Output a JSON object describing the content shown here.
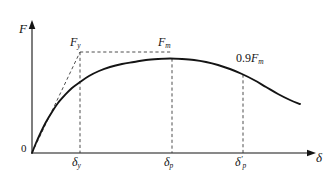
{
  "figure": {
    "name": "load-displacement-curve",
    "background_color": "#ffffff",
    "line_color": "#141414",
    "dash_color": "#3a3a3a"
  },
  "axes": {
    "y_label": "F",
    "x_label": "δ",
    "origin_label": "0",
    "x_axis_start_px": 32,
    "x_axis_end_px": 318,
    "y_axis_top_px": 22,
    "baseline_px": 153
  },
  "annotations": {
    "fy": {
      "text": "F",
      "sub": "y"
    },
    "fm": {
      "text": "F",
      "sub": "m"
    },
    "nine_tenths_fm": {
      "prefix": "0.9",
      "text": "F",
      "sub": "m"
    },
    "delta_y": {
      "text": "δ",
      "sub": "y"
    },
    "delta_p": {
      "text": "δ",
      "sub": "p"
    },
    "delta_p_prime": {
      "text": "δ",
      "prime": "′",
      "sub": "p"
    }
  },
  "chart_data": {
    "type": "line",
    "title": "",
    "xlabel": "δ",
    "ylabel": "F",
    "grid": false,
    "legend": null,
    "xlim": [
      0,
      1
    ],
    "ylim": [
      0,
      1
    ],
    "series": [
      {
        "name": "load-displacement-curve",
        "style": "solid",
        "points_px": [
          [
            32,
            153
          ],
          [
            36,
            143
          ],
          [
            41,
            132
          ],
          [
            46,
            122
          ],
          [
            52,
            112
          ],
          [
            58,
            103
          ],
          [
            65,
            95
          ],
          [
            72,
            88
          ],
          [
            80,
            82
          ],
          [
            89,
            76
          ],
          [
            99,
            71
          ],
          [
            110,
            67
          ],
          [
            122,
            64
          ],
          [
            134,
            62
          ],
          [
            146,
            60
          ],
          [
            158,
            59
          ],
          [
            170,
            58.5
          ],
          [
            182,
            59
          ],
          [
            194,
            60
          ],
          [
            206,
            62
          ],
          [
            218,
            65
          ],
          [
            230,
            69
          ],
          [
            242,
            74
          ],
          [
            254,
            80
          ],
          [
            266,
            87
          ],
          [
            278,
            94
          ],
          [
            290,
            100
          ],
          [
            300,
            104
          ]
        ]
      },
      {
        "name": "idealized-elastic-segment",
        "style": "dashed",
        "points_px": [
          [
            32,
            153
          ],
          [
            80,
            52
          ]
        ]
      },
      {
        "name": "fy-horizontal-dashed",
        "style": "dashed",
        "points_px": [
          [
            80,
            52
          ],
          [
            172,
            52
          ]
        ]
      },
      {
        "name": "delta-y-vertical-dashed",
        "style": "dashed",
        "points_px": [
          [
            80,
            52
          ],
          [
            80,
            153
          ]
        ]
      },
      {
        "name": "delta-p-vertical-dashed",
        "style": "dashed",
        "points_px": [
          [
            172,
            58.5
          ],
          [
            172,
            153
          ]
        ]
      },
      {
        "name": "delta-p-prime-vertical-dashed",
        "style": "dashed",
        "points_px": [
          [
            243,
            74.5
          ],
          [
            243,
            153
          ]
        ]
      }
    ],
    "markers": [
      {
        "name": "yield-point",
        "label": "Fy",
        "x_px": 80,
        "y_px": 52
      },
      {
        "name": "peak-point",
        "label": "Fm",
        "x_px": 172,
        "y_px": 58.5
      },
      {
        "name": "post-peak-point",
        "label": "0.9Fm",
        "x_px": 243,
        "y_px": 74.5
      }
    ],
    "ticks_x_px": [
      80,
      172,
      243
    ],
    "tick_labels_x": [
      "δy",
      "δp",
      "δ′p"
    ]
  }
}
